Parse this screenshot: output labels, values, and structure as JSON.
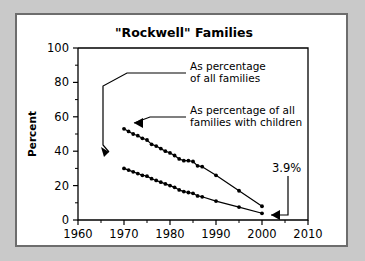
{
  "figure": {
    "title": "\"Rockwell\" Families",
    "background_color": "#ffffff",
    "outer_background_color": "#c9c9c9",
    "border_color": "#6d6d6d",
    "line_color": "#000000"
  },
  "axes": {
    "x": {
      "label": "",
      "ticks": [
        "1960",
        "1970",
        "1980",
        "1990",
        "2000",
        "2010"
      ],
      "min": 1960,
      "max": 2010,
      "minor_tick_step": 5
    },
    "y": {
      "label": "Percent",
      "ticks": [
        "0",
        "20",
        "40",
        "60",
        "80",
        "100"
      ],
      "min": 0,
      "max": 100,
      "minor_tick_step": 10
    }
  },
  "annotations": [
    {
      "name": "annotation-all-families",
      "lines": [
        "As percentage",
        "of all families"
      ],
      "target_series": "As percentage of all families"
    },
    {
      "name": "annotation-families-with-children",
      "lines": [
        "As percentage of all",
        "families with children"
      ],
      "target_series": "As percentage of all families with children"
    },
    {
      "name": "callout-final-value",
      "lines": [
        "3.9%"
      ],
      "target_series": "As percentage of all families"
    }
  ],
  "chart_data": {
    "type": "line",
    "title": "\"Rockwell\" Families",
    "xlabel": "",
    "ylabel": "Percent",
    "xlim": [
      1960,
      2010
    ],
    "ylim": [
      0,
      100
    ],
    "grid": false,
    "legend_position": "inline-annotations",
    "series": [
      {
        "name": "As percentage of all families with children",
        "short_label": "families with children",
        "marker": "filled-circle",
        "x": [
          1970,
          1971,
          1972,
          1973,
          1974,
          1975,
          1976,
          1977,
          1978,
          1979,
          1980,
          1981,
          1982,
          1983,
          1984,
          1985,
          1986,
          1987,
          1990,
          1995,
          2000
        ],
        "values": [
          53.0,
          51.5,
          50.0,
          49.0,
          47.5,
          46.5,
          44.0,
          43.0,
          41.5,
          40.0,
          39.0,
          37.5,
          35.5,
          34.5,
          34.5,
          34.0,
          31.5,
          31.0,
          26.0,
          17.0,
          8.0
        ]
      },
      {
        "name": "As percentage of all families",
        "short_label": "all families",
        "marker": "filled-circle",
        "x": [
          1970,
          1971,
          1972,
          1973,
          1974,
          1975,
          1976,
          1977,
          1978,
          1979,
          1980,
          1981,
          1982,
          1983,
          1984,
          1985,
          1986,
          1987,
          1990,
          1995,
          2000
        ],
        "values": [
          30.0,
          29.0,
          28.0,
          27.0,
          26.0,
          25.5,
          24.0,
          23.0,
          22.0,
          21.0,
          20.0,
          19.0,
          17.5,
          16.5,
          16.0,
          15.5,
          14.0,
          13.5,
          11.0,
          7.5,
          3.9
        ],
        "final_value_label": "3.9%"
      }
    ]
  }
}
